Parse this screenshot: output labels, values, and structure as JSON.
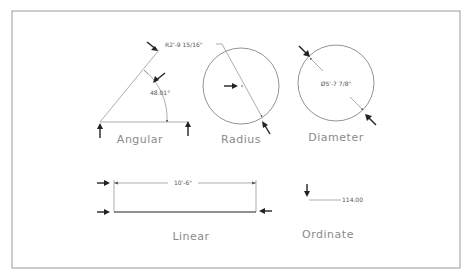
{
  "drawing": {
    "sections": {
      "angular": {
        "title": "Angular",
        "dimension": "48.01°"
      },
      "radius": {
        "title": "Radius",
        "dimension": "R2'-9 15/16\""
      },
      "diameter": {
        "title": "Diameter",
        "dimension": "Ø5'-7 7/8\""
      },
      "linear": {
        "title": "Linear",
        "dimension": "10'-6\""
      },
      "ordinate": {
        "title": "Ordinate",
        "dimension": "114.00"
      }
    },
    "colors": {
      "line": "#777777",
      "arrow": "#222222",
      "label": "#8a8a8a",
      "frame": "#999999"
    }
  }
}
